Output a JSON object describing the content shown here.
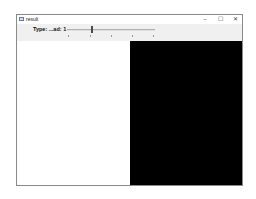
{
  "window": {
    "title": "result",
    "controls": {
      "minimize": "–",
      "maximize": "☐",
      "close": "✕"
    }
  },
  "toolbar": {
    "slider": {
      "label": "Type: ...ad: 1",
      "value": 1,
      "ticks": [
        0,
        1,
        2,
        3,
        4
      ]
    }
  },
  "content": {
    "left_pane_color": "#ffffff",
    "right_pane_color": "#000000"
  }
}
